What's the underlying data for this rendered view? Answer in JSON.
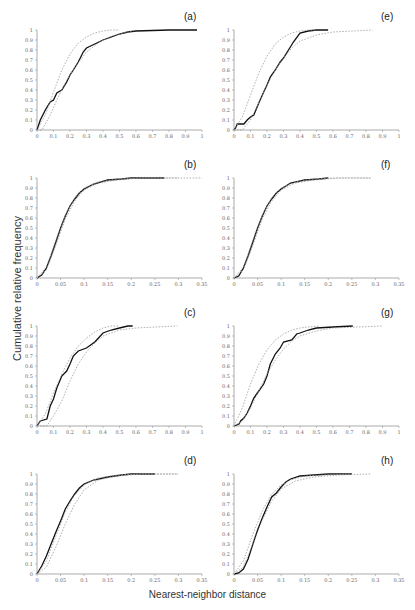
{
  "figure": {
    "ylabel": "Cumulative relative frequency",
    "xlabel": "Nearest-neighbor distance"
  },
  "chart_data": [
    {
      "panel": "(a)",
      "type": "line",
      "xlim": [
        0,
        1
      ],
      "ylim": [
        0,
        1
      ],
      "xticks": [
        0,
        0.1,
        0.2,
        0.3,
        0.4,
        0.5,
        0.6,
        0.7,
        0.8,
        0.9,
        1
      ],
      "yticks": [
        0,
        0.1,
        0.2,
        0.3,
        0.4,
        0.5,
        0.6,
        0.7,
        0.8,
        0.9,
        1
      ],
      "series": [
        {
          "name": "observed",
          "style": "solid-black",
          "x": [
            0,
            0.02,
            0.05,
            0.08,
            0.1,
            0.12,
            0.15,
            0.18,
            0.2,
            0.22,
            0.25,
            0.28,
            0.3,
            0.35,
            0.4,
            0.45,
            0.5,
            0.55,
            0.6,
            0.8,
            0.97
          ],
          "y": [
            0,
            0.1,
            0.2,
            0.28,
            0.3,
            0.37,
            0.4,
            0.48,
            0.55,
            0.6,
            0.68,
            0.78,
            0.82,
            0.86,
            0.9,
            0.93,
            0.96,
            0.98,
            0.99,
            1,
            1
          ]
        },
        {
          "name": "envelope-upper",
          "style": "dotted-gray",
          "x": [
            0,
            0.05,
            0.1,
            0.15,
            0.2,
            0.25,
            0.3,
            0.35,
            0.4,
            0.45,
            0.5
          ],
          "y": [
            0,
            0.15,
            0.38,
            0.6,
            0.76,
            0.87,
            0.93,
            0.97,
            0.99,
            1,
            1
          ]
        },
        {
          "name": "envelope-lower",
          "style": "dotted-gray",
          "x": [
            0,
            0.03,
            0.08,
            0.12,
            0.18,
            0.24,
            0.3,
            0.38,
            0.45,
            0.55,
            0.6
          ],
          "y": [
            0,
            0,
            0.15,
            0.3,
            0.5,
            0.65,
            0.78,
            0.88,
            0.94,
            0.98,
            1
          ]
        }
      ]
    },
    {
      "panel": "(b)",
      "type": "line",
      "xlim": [
        0,
        0.35
      ],
      "ylim": [
        0,
        1
      ],
      "xticks": [
        0,
        0.05,
        0.1,
        0.15,
        0.2,
        0.25,
        0.3,
        0.35
      ],
      "yticks": [
        0,
        0.1,
        0.2,
        0.3,
        0.4,
        0.5,
        0.6,
        0.7,
        0.8,
        0.9,
        1
      ],
      "series": [
        {
          "name": "observed",
          "style": "solid-black",
          "x": [
            0,
            0.01,
            0.02,
            0.03,
            0.04,
            0.05,
            0.06,
            0.07,
            0.08,
            0.09,
            0.1,
            0.12,
            0.15,
            0.18,
            0.2,
            0.27
          ],
          "y": [
            0,
            0.03,
            0.1,
            0.22,
            0.36,
            0.5,
            0.62,
            0.72,
            0.79,
            0.85,
            0.89,
            0.94,
            0.98,
            0.99,
            1,
            1
          ]
        },
        {
          "name": "envelope-upper",
          "style": "dotted-gray",
          "x": [
            0,
            0.02,
            0.04,
            0.06,
            0.08,
            0.1,
            0.13,
            0.17,
            0.22,
            0.35
          ],
          "y": [
            0,
            0.11,
            0.38,
            0.63,
            0.8,
            0.9,
            0.96,
            0.99,
            1,
            1
          ]
        },
        {
          "name": "envelope-lower",
          "style": "dotted-gray",
          "x": [
            0,
            0.02,
            0.04,
            0.06,
            0.08,
            0.1,
            0.13,
            0.17,
            0.22,
            0.3
          ],
          "y": [
            0,
            0.08,
            0.33,
            0.59,
            0.77,
            0.88,
            0.95,
            0.98,
            1,
            1
          ]
        }
      ]
    },
    {
      "panel": "(c)",
      "type": "line",
      "xlim": [
        0,
        1
      ],
      "ylim": [
        0,
        1
      ],
      "xticks": [
        0,
        0.1,
        0.2,
        0.3,
        0.4,
        0.5,
        0.6,
        0.7,
        0.8,
        0.9,
        1
      ],
      "yticks": [
        0,
        0.1,
        0.2,
        0.3,
        0.4,
        0.5,
        0.6,
        0.7,
        0.8,
        0.9,
        1
      ],
      "series": [
        {
          "name": "observed",
          "style": "solid-black",
          "x": [
            0,
            0.02,
            0.06,
            0.08,
            0.1,
            0.12,
            0.15,
            0.18,
            0.2,
            0.22,
            0.25,
            0.3,
            0.35,
            0.4,
            0.45,
            0.5,
            0.55,
            0.58
          ],
          "y": [
            0,
            0.05,
            0.07,
            0.2,
            0.27,
            0.38,
            0.5,
            0.55,
            0.62,
            0.7,
            0.75,
            0.78,
            0.84,
            0.93,
            0.96,
            0.98,
            1,
            1
          ]
        },
        {
          "name": "envelope-upper",
          "style": "dotted-gray",
          "x": [
            0,
            0.05,
            0.1,
            0.15,
            0.2,
            0.25,
            0.3,
            0.35,
            0.4,
            0.45,
            0.5
          ],
          "y": [
            0,
            0.12,
            0.33,
            0.52,
            0.68,
            0.8,
            0.88,
            0.94,
            0.98,
            1,
            1
          ]
        },
        {
          "name": "envelope-lower",
          "style": "dotted-gray",
          "x": [
            0,
            0.06,
            0.1,
            0.15,
            0.2,
            0.25,
            0.3,
            0.35,
            0.4,
            0.5,
            0.6,
            0.85
          ],
          "y": [
            0,
            0,
            0.1,
            0.25,
            0.45,
            0.62,
            0.74,
            0.83,
            0.9,
            0.96,
            0.98,
            1
          ]
        }
      ]
    },
    {
      "panel": "(d)",
      "type": "line",
      "xlim": [
        0,
        0.35
      ],
      "ylim": [
        0,
        1
      ],
      "xticks": [
        0,
        0.05,
        0.1,
        0.15,
        0.2,
        0.25,
        0.3,
        0.35
      ],
      "yticks": [
        0,
        0.1,
        0.2,
        0.3,
        0.4,
        0.5,
        0.6,
        0.7,
        0.8,
        0.9,
        1
      ],
      "series": [
        {
          "name": "observed",
          "style": "solid-black",
          "x": [
            0,
            0.01,
            0.02,
            0.03,
            0.04,
            0.05,
            0.06,
            0.07,
            0.08,
            0.09,
            0.1,
            0.12,
            0.15,
            0.18,
            0.2,
            0.25
          ],
          "y": [
            0,
            0.08,
            0.18,
            0.3,
            0.42,
            0.53,
            0.65,
            0.73,
            0.8,
            0.86,
            0.9,
            0.94,
            0.97,
            0.99,
            1,
            1
          ]
        },
        {
          "name": "envelope-upper",
          "style": "dotted-gray",
          "x": [
            0,
            0.02,
            0.04,
            0.06,
            0.08,
            0.1,
            0.13,
            0.17,
            0.22,
            0.3
          ],
          "y": [
            0,
            0.13,
            0.38,
            0.62,
            0.79,
            0.89,
            0.96,
            0.99,
            1,
            1
          ]
        },
        {
          "name": "envelope-lower",
          "style": "dotted-gray",
          "x": [
            0,
            0.02,
            0.04,
            0.06,
            0.08,
            0.1,
            0.13,
            0.17,
            0.22,
            0.3
          ],
          "y": [
            0,
            0.07,
            0.27,
            0.5,
            0.7,
            0.84,
            0.94,
            0.98,
            1,
            1
          ]
        }
      ]
    },
    {
      "panel": "(e)",
      "type": "line",
      "xlim": [
        0,
        1
      ],
      "ylim": [
        0,
        1
      ],
      "xticks": [
        0,
        0.1,
        0.2,
        0.3,
        0.4,
        0.5,
        0.6,
        0.7,
        0.8,
        0.9,
        1
      ],
      "yticks": [
        0,
        0.1,
        0.2,
        0.3,
        0.4,
        0.5,
        0.6,
        0.7,
        0.8,
        0.9,
        1
      ],
      "series": [
        {
          "name": "observed",
          "style": "solid-black",
          "x": [
            0,
            0.01,
            0.02,
            0.06,
            0.08,
            0.1,
            0.12,
            0.15,
            0.18,
            0.2,
            0.22,
            0.25,
            0.28,
            0.3,
            0.33,
            0.36,
            0.4,
            0.45,
            0.5,
            0.57
          ],
          "y": [
            0,
            0.02,
            0.06,
            0.06,
            0.1,
            0.13,
            0.15,
            0.27,
            0.38,
            0.45,
            0.53,
            0.6,
            0.68,
            0.72,
            0.8,
            0.88,
            0.97,
            0.99,
            1,
            1
          ]
        },
        {
          "name": "envelope-upper",
          "style": "dotted-gray",
          "x": [
            0,
            0.05,
            0.1,
            0.15,
            0.2,
            0.25,
            0.3,
            0.35,
            0.4,
            0.45,
            0.5
          ],
          "y": [
            0,
            0.13,
            0.35,
            0.57,
            0.74,
            0.86,
            0.93,
            0.97,
            0.99,
            1,
            1
          ]
        },
        {
          "name": "envelope-lower",
          "style": "dotted-gray",
          "x": [
            0,
            0.05,
            0.1,
            0.15,
            0.2,
            0.25,
            0.3,
            0.35,
            0.4,
            0.5,
            0.6,
            0.84
          ],
          "y": [
            0,
            0,
            0.1,
            0.27,
            0.45,
            0.6,
            0.72,
            0.82,
            0.89,
            0.95,
            0.98,
            1
          ]
        }
      ]
    },
    {
      "panel": "(f)",
      "type": "line",
      "xlim": [
        0,
        0.35
      ],
      "ylim": [
        0,
        1
      ],
      "xticks": [
        0,
        0.05,
        0.1,
        0.15,
        0.2,
        0.25,
        0.3,
        0.35
      ],
      "yticks": [
        0,
        0.1,
        0.2,
        0.3,
        0.4,
        0.5,
        0.6,
        0.7,
        0.8,
        0.9,
        1
      ],
      "series": [
        {
          "name": "observed",
          "style": "solid-black",
          "x": [
            0,
            0.01,
            0.02,
            0.03,
            0.04,
            0.05,
            0.06,
            0.07,
            0.08,
            0.09,
            0.1,
            0.12,
            0.15,
            0.18,
            0.2
          ],
          "y": [
            0,
            0.02,
            0.1,
            0.22,
            0.36,
            0.5,
            0.62,
            0.72,
            0.79,
            0.85,
            0.89,
            0.95,
            0.98,
            0.99,
            1
          ]
        },
        {
          "name": "envelope-upper",
          "style": "dotted-gray",
          "x": [
            0,
            0.02,
            0.04,
            0.06,
            0.08,
            0.1,
            0.13,
            0.17,
            0.22,
            0.29
          ],
          "y": [
            0,
            0.11,
            0.38,
            0.63,
            0.8,
            0.9,
            0.96,
            0.99,
            1,
            1
          ]
        },
        {
          "name": "envelope-lower",
          "style": "dotted-gray",
          "x": [
            0,
            0.02,
            0.04,
            0.06,
            0.08,
            0.1,
            0.13,
            0.17,
            0.22,
            0.29
          ],
          "y": [
            0,
            0.08,
            0.33,
            0.59,
            0.77,
            0.88,
            0.95,
            0.98,
            1,
            1
          ]
        }
      ]
    },
    {
      "panel": "(g)",
      "type": "line",
      "xlim": [
        0,
        1
      ],
      "ylim": [
        0,
        1
      ],
      "xticks": [
        0,
        0.1,
        0.2,
        0.3,
        0.4,
        0.5,
        0.6,
        0.7,
        0.8,
        0.9,
        1
      ],
      "yticks": [
        0,
        0.1,
        0.2,
        0.3,
        0.4,
        0.5,
        0.6,
        0.7,
        0.8,
        0.9,
        1
      ],
      "series": [
        {
          "name": "observed",
          "style": "solid-black",
          "x": [
            0,
            0.03,
            0.04,
            0.06,
            0.08,
            0.1,
            0.12,
            0.15,
            0.18,
            0.2,
            0.22,
            0.25,
            0.28,
            0.3,
            0.35,
            0.38,
            0.4,
            0.45,
            0.5,
            0.6,
            0.72
          ],
          "y": [
            0,
            0.02,
            0.05,
            0.08,
            0.13,
            0.2,
            0.28,
            0.35,
            0.42,
            0.5,
            0.62,
            0.72,
            0.78,
            0.84,
            0.86,
            0.92,
            0.93,
            0.96,
            0.98,
            0.99,
            1
          ]
        },
        {
          "name": "envelope-upper",
          "style": "dotted-gray",
          "x": [
            0,
            0.05,
            0.1,
            0.15,
            0.2,
            0.25,
            0.3,
            0.35,
            0.4,
            0.45,
            0.52
          ],
          "y": [
            0,
            0.18,
            0.42,
            0.62,
            0.76,
            0.86,
            0.92,
            0.96,
            0.98,
            0.99,
            1
          ]
        },
        {
          "name": "envelope-lower",
          "style": "dotted-gray",
          "x": [
            0,
            0.05,
            0.1,
            0.15,
            0.2,
            0.25,
            0.3,
            0.35,
            0.4,
            0.5,
            0.6,
            0.9
          ],
          "y": [
            0,
            0.05,
            0.18,
            0.35,
            0.52,
            0.66,
            0.77,
            0.85,
            0.9,
            0.95,
            0.98,
            1
          ]
        }
      ]
    },
    {
      "panel": "(h)",
      "type": "line",
      "xlim": [
        0,
        0.35
      ],
      "ylim": [
        0,
        1
      ],
      "xticks": [
        0,
        0.05,
        0.1,
        0.15,
        0.2,
        0.25,
        0.3,
        0.35
      ],
      "yticks": [
        0,
        0.1,
        0.2,
        0.3,
        0.4,
        0.5,
        0.6,
        0.7,
        0.8,
        0.9,
        1
      ],
      "series": [
        {
          "name": "observed",
          "style": "solid-black",
          "x": [
            0,
            0.01,
            0.02,
            0.03,
            0.04,
            0.05,
            0.06,
            0.07,
            0.08,
            0.09,
            0.1,
            0.11,
            0.12,
            0.14,
            0.17,
            0.2,
            0.25
          ],
          "y": [
            0,
            0.01,
            0.05,
            0.15,
            0.3,
            0.44,
            0.56,
            0.67,
            0.77,
            0.81,
            0.87,
            0.92,
            0.95,
            0.98,
            0.99,
            1,
            1
          ]
        },
        {
          "name": "envelope-upper",
          "style": "dotted-gray",
          "x": [
            0,
            0.02,
            0.04,
            0.06,
            0.08,
            0.1,
            0.12,
            0.15,
            0.19,
            0.25
          ],
          "y": [
            0,
            0.13,
            0.4,
            0.63,
            0.8,
            0.89,
            0.94,
            0.98,
            0.99,
            1
          ]
        },
        {
          "name": "envelope-lower",
          "style": "dotted-gray",
          "x": [
            0,
            0.02,
            0.04,
            0.06,
            0.08,
            0.1,
            0.13,
            0.17,
            0.22,
            0.29
          ],
          "y": [
            0,
            0.07,
            0.3,
            0.54,
            0.73,
            0.85,
            0.93,
            0.97,
            0.99,
            1
          ]
        }
      ]
    }
  ]
}
